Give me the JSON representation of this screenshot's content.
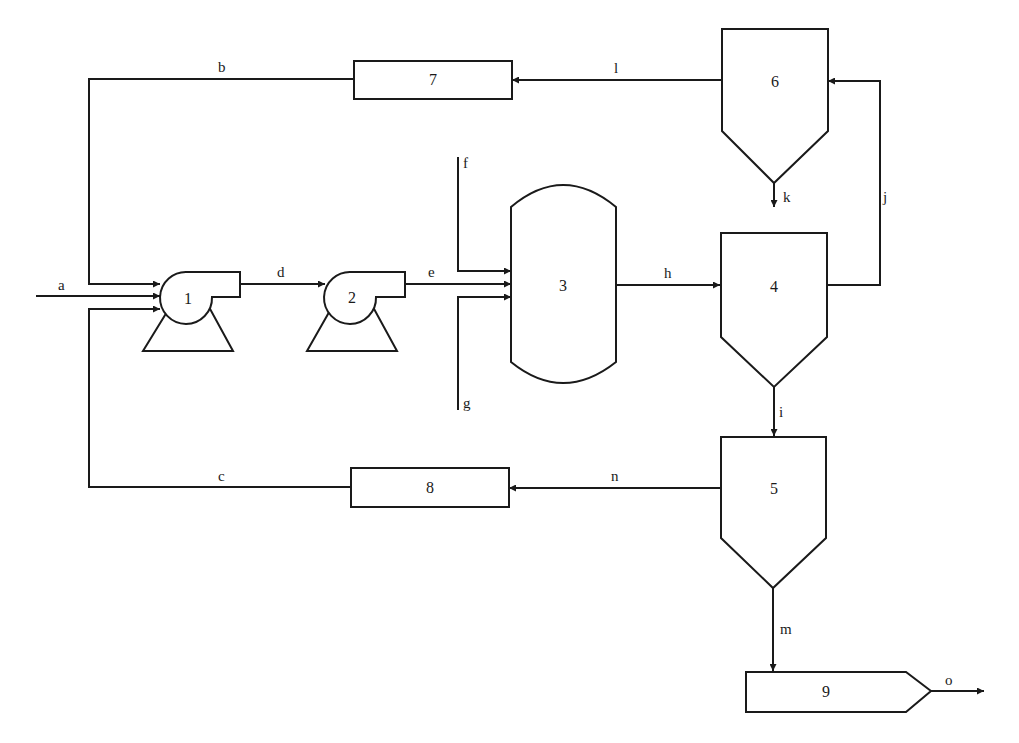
{
  "diagram": {
    "type": "process-flow-diagram",
    "units": {
      "u1": "1",
      "u2": "2",
      "u3": "3",
      "u4": "4",
      "u5": "5",
      "u6": "6",
      "u7": "7",
      "u8": "8",
      "u9": "9"
    },
    "streams": {
      "a": "a",
      "b": "b",
      "c": "c",
      "d": "d",
      "e": "e",
      "f": "f",
      "g": "g",
      "h": "h",
      "i": "i",
      "j": "j",
      "k": "k",
      "l": "l",
      "m": "m",
      "n": "n",
      "o": "o"
    },
    "connections": [
      {
        "stream": "a",
        "from": "feed",
        "to": "1"
      },
      {
        "stream": "b",
        "from": "7",
        "to": "1"
      },
      {
        "stream": "c",
        "from": "8",
        "to": "1"
      },
      {
        "stream": "d",
        "from": "1",
        "to": "2"
      },
      {
        "stream": "e",
        "from": "2",
        "to": "3"
      },
      {
        "stream": "f",
        "from": "feed",
        "to": "3"
      },
      {
        "stream": "g",
        "from": "feed",
        "to": "3"
      },
      {
        "stream": "h",
        "from": "3",
        "to": "4"
      },
      {
        "stream": "i",
        "from": "4",
        "to": "5"
      },
      {
        "stream": "j",
        "from": "4",
        "to": "6"
      },
      {
        "stream": "k",
        "from": "6",
        "to": "out"
      },
      {
        "stream": "l",
        "from": "6",
        "to": "7"
      },
      {
        "stream": "m",
        "from": "5",
        "to": "9"
      },
      {
        "stream": "n",
        "from": "5",
        "to": "8"
      },
      {
        "stream": "o",
        "from": "9",
        "to": "out"
      }
    ],
    "colors": {
      "line": "#1a1a1a",
      "background": "#ffffff"
    }
  }
}
